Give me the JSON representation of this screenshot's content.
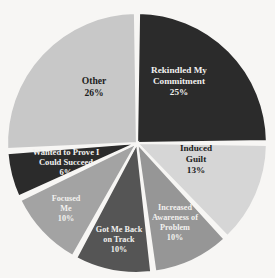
{
  "chart_data": {
    "type": "pie",
    "title": "",
    "subtitle": "",
    "xlabel": "",
    "ylabel": "",
    "legend": "none",
    "grid": false,
    "units": "percent",
    "total": 100,
    "start_angle_deg": 0,
    "direction": "clockwise",
    "categories": [
      "Rekindled My Commitment",
      "Induced Guilt",
      "Increased Awareness of Problem",
      "Got Me Back on Track",
      "Focused Me",
      "Wanted to Prove I Could Succeed",
      "Other"
    ],
    "values": [
      25,
      13,
      10,
      10,
      10,
      6,
      26
    ],
    "value_labels": [
      "25%",
      "13%",
      "10%",
      "10%",
      "10%",
      "6%",
      "26%"
    ],
    "colors": [
      "#2b2b2b",
      "#d6d6d6",
      "#969696",
      "#555555",
      "#a3a3a3",
      "#2b2b2b",
      "#c8c8c8"
    ],
    "slices": [
      {
        "label": "Rekindled My Commitment",
        "label_lines": [
          "Rekindled My",
          "Commitment"
        ],
        "value": 25,
        "value_label": "25%",
        "color": "#2b2b2b",
        "text_color": "light",
        "label_x": 179,
        "label_y": 82,
        "font_size": 9.2
      },
      {
        "label": "Induced Guilt",
        "label_lines": [
          "Induced",
          "Guilt"
        ],
        "value": 13,
        "value_label": "13%",
        "color": "#d6d6d6",
        "text_color": "dark",
        "label_x": 196,
        "label_y": 160,
        "font_size": 9.2
      },
      {
        "label": "Increased Awareness of Problem",
        "label_lines": [
          "Increased",
          "Awareness of",
          "Problem"
        ],
        "value": 10,
        "value_label": "10%",
        "color": "#969696",
        "text_color": "light",
        "label_x": 175,
        "label_y": 223,
        "font_size": 8.2
      },
      {
        "label": "Got Me Back on Track",
        "label_lines": [
          "Got Me Back",
          "on Track"
        ],
        "value": 10,
        "value_label": "10%",
        "color": "#555555",
        "text_color": "light",
        "label_x": 119,
        "label_y": 240,
        "font_size": 8.2
      },
      {
        "label": "Focused Me",
        "label_lines": [
          "Focused",
          "Me"
        ],
        "value": 10,
        "value_label": "10%",
        "color": "#a3a3a3",
        "text_color": "light",
        "label_x": 66,
        "label_y": 209,
        "font_size": 8.2
      },
      {
        "label": "Wanted to Prove I Could Succeed",
        "label_lines": [
          "Wanted to Prove I",
          "Could Succeed"
        ],
        "value": 6,
        "value_label": "6%",
        "color": "#2b2b2b",
        "text_color": "light",
        "label_x": 66,
        "label_y": 163,
        "font_size": 8.6
      },
      {
        "label": "Other",
        "label_lines": [
          "Other"
        ],
        "value": 26,
        "value_label": "26%",
        "color": "#c8c8c8",
        "text_color": "dark",
        "label_x": 94,
        "label_y": 88,
        "font_size": 9.6
      }
    ]
  }
}
